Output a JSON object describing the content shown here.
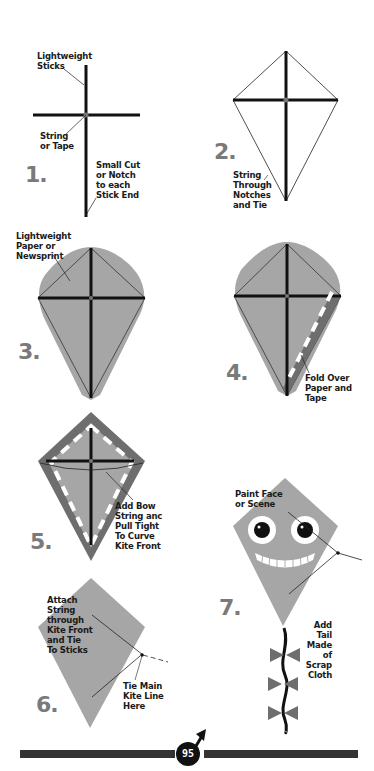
{
  "page_number": "95",
  "colors": {
    "kite_fill": "#a6a6a6",
    "kite_border": "#6e6e6e",
    "stick": "#111111",
    "step_number": "#7a7a7a",
    "footer_bar": "#333333"
  },
  "steps": [
    {
      "number": "1.",
      "labels": {
        "sticks": "Lightweight\nSticks",
        "string": "String\nor Tape",
        "notch": "Small Cut\nor Notch\nto each\nStick End"
      }
    },
    {
      "number": "2.",
      "labels": {
        "string": "String\nThrough\nNotches\nand Tie"
      }
    },
    {
      "number": "3.",
      "labels": {
        "paper": "Lightweight\nPaper or\nNewsprint"
      }
    },
    {
      "number": "4.",
      "labels": {
        "fold": "Fold Over\nPaper and\nTape"
      }
    },
    {
      "number": "5.",
      "labels": {
        "bow": "Add Bow\nString anc\nPull Tight\nTo Curve\nKite Front"
      }
    },
    {
      "number": "6.",
      "labels": {
        "attach": "Attach\nString\nthrough\nKite Front\nand Tie\nTo Sticks",
        "tie": "Tie Main\nKite Line\nHere"
      }
    },
    {
      "number": "7.",
      "labels": {
        "paint": "Paint Face\nor Scene",
        "tail": "Add\nTail\nMade\nof\nScrap\nCloth"
      }
    }
  ]
}
